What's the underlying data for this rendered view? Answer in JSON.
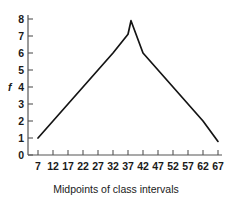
{
  "chart_data": {
    "type": "line",
    "title": "",
    "subtitle": "",
    "xlabel": "Midpoints of class intervals",
    "ylabel": "f",
    "x": [
      7,
      12,
      17,
      22,
      27,
      32,
      37,
      38,
      42,
      47,
      52,
      57,
      62,
      67
    ],
    "values": [
      1,
      2,
      3,
      4,
      5,
      6,
      7.1,
      7.9,
      6,
      5,
      4,
      3,
      2,
      0.8
    ],
    "series": [
      {
        "name": "frequency",
        "x": [
          7,
          12,
          17,
          22,
          27,
          32,
          37,
          38,
          42,
          47,
          52,
          57,
          62,
          67
        ],
        "values": [
          1,
          2,
          3,
          4,
          5,
          6,
          7.1,
          7.9,
          6,
          5,
          4,
          3,
          2,
          0.8
        ]
      }
    ],
    "xticks": [
      7,
      12,
      17,
      22,
      27,
      32,
      37,
      42,
      47,
      52,
      57,
      62,
      67
    ],
    "xtick_labels": [
      "7",
      "12",
      "17",
      "22",
      "27",
      "32",
      "37",
      "42",
      "47",
      "52",
      "57",
      "62",
      "67"
    ],
    "yticks": [
      0,
      1,
      2,
      3,
      4,
      5,
      6,
      7,
      8
    ],
    "ytick_labels": [
      "0",
      "1",
      "2",
      "3",
      "4",
      "5",
      "6",
      "7",
      "8"
    ],
    "xlim": [
      4.5,
      69.5
    ],
    "ylim": [
      0,
      8.35
    ],
    "grid": false,
    "legend": false,
    "legend_position": "none",
    "line_color": "#141414",
    "axis_color": "#555555",
    "background_color": "#ffffff"
  },
  "labels": {
    "y_axis_title": "f",
    "x_axis_caption": "Midpoints of class intervals"
  }
}
